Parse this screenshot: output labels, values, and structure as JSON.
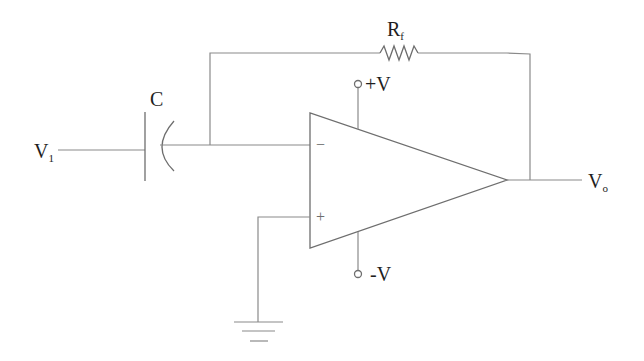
{
  "diagram": {
    "type": "op-amp differentiator circuit",
    "labels": {
      "input": {
        "main": "V",
        "sub": "1"
      },
      "capacitor": "C",
      "feedback_resistor": {
        "main": "R",
        "sub": "f"
      },
      "positive_supply": "+V",
      "negative_supply": "-V",
      "output": {
        "main": "V",
        "sub": "o"
      },
      "inverting_input": "−",
      "non_inverting_input": "+"
    },
    "colors": {
      "wire": "#8a8a8a",
      "component": "#6e6e6e",
      "text": "#1e1e1e",
      "background": "#ffffff"
    }
  }
}
